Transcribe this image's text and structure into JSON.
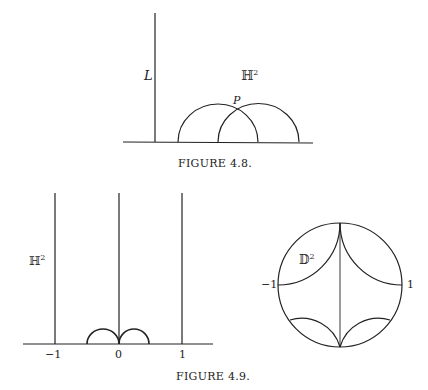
{
  "figure_4_8": {
    "caption": "FIGURE 4.8.",
    "line_label": "L",
    "space_label": "ℍ",
    "space_exp": "2",
    "point_label": "P"
  },
  "figure_4_9": {
    "caption": "FIGURE 4.9.",
    "halfplane": {
      "space_label": "ℍ",
      "space_exp": "2",
      "ticks": [
        "−1",
        "0",
        "1"
      ]
    },
    "disk": {
      "space_label": "𝔻",
      "space_exp": "2",
      "left_label": "−1",
      "right_label": "1"
    }
  },
  "colors": {
    "ink": "#222222",
    "background": "#ffffff"
  }
}
